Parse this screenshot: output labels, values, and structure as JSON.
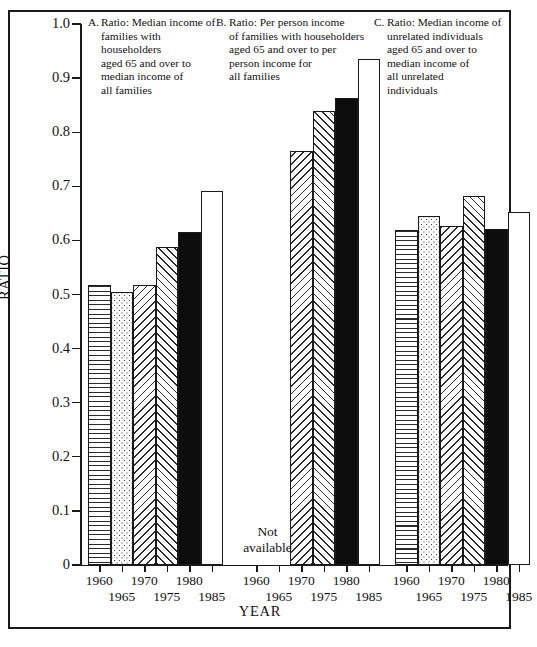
{
  "figure": {
    "y_axis_title": "RATIO",
    "x_axis_title": "YEAR",
    "y_ticks": [
      "1.0",
      "0.9",
      "0.8",
      "0.7",
      "0.6",
      "0.5",
      "0.4",
      "0.3",
      "0.2",
      "0.1",
      "0"
    ],
    "not_available_text_line1": "Not",
    "not_available_text_line2": "available"
  },
  "panels": [
    {
      "letter": "A.",
      "caption": "Ratio: Median income of families with householders aged 65 and over to median income of all families",
      "caption_lines": [
        "Ratio: Median income of",
        "families with householders",
        "aged 65 and over to",
        "median income of",
        "all families"
      ]
    },
    {
      "letter": "B.",
      "caption": "Ratio: Per person income of families with householders aged 65 and over to per person income for all families",
      "caption_lines": [
        "Ratio: Per person income",
        "of families with householders",
        "aged 65 and over to per",
        "person income for",
        "all families"
      ]
    },
    {
      "letter": "C.",
      "caption": "Ratio: Median income of unrelated individuals aged 65 and over to median income of all unrelated individuals",
      "caption_lines": [
        "Ratio: Median income of",
        "unrelated individuals",
        "aged 65 and over to",
        "median income of",
        "all unrelated",
        "individuals"
      ]
    }
  ],
  "chart_data": {
    "type": "bar",
    "title": "",
    "xlabel": "YEAR",
    "ylabel": "RATIO",
    "ylim": [
      0,
      1.0
    ],
    "ytick_values": [
      0,
      0.1,
      0.2,
      0.3,
      0.4,
      0.5,
      0.6,
      0.7,
      0.8,
      0.9,
      1.0
    ],
    "grid": false,
    "legend": "none",
    "categories": [
      "1960",
      "1965",
      "1970",
      "1975",
      "1980",
      "1985"
    ],
    "patterns": [
      "horizontal-lines",
      "dots",
      "diagonal-hatch-left",
      "diagonal-hatch-right",
      "solid-black",
      "open-white"
    ],
    "panels": [
      {
        "name": "A",
        "title": "Ratio: Median income of families with householders aged 65 and over to median income of all families",
        "values": [
          0.518,
          0.505,
          0.518,
          0.588,
          0.616,
          0.691
        ]
      },
      {
        "name": "B",
        "title": "Ratio: Per person income of families with householders aged 65 and over to per person income for all families",
        "values": [
          null,
          null,
          0.765,
          0.84,
          0.864,
          0.936
        ],
        "note": "Not available for 1960 and 1965"
      },
      {
        "name": "C",
        "title": "Ratio: Median income of unrelated individuals aged 65 and over to median income of all unrelated individuals",
        "values": [
          0.619,
          0.645,
          0.627,
          0.683,
          0.622,
          0.653
        ]
      }
    ]
  }
}
